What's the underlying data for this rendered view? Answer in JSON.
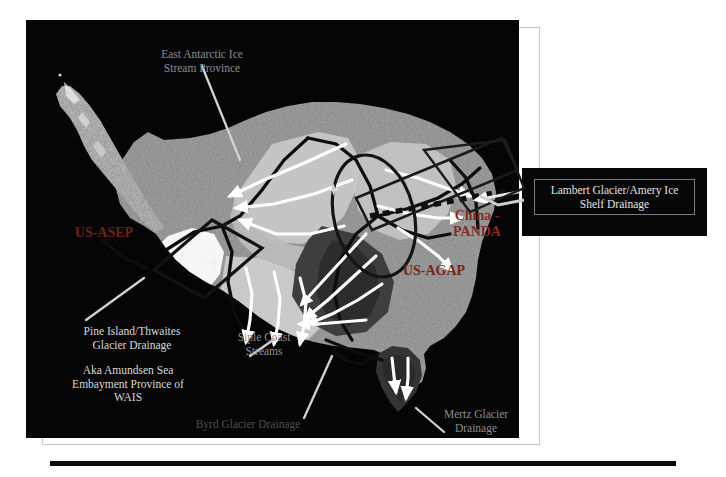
{
  "slide": {
    "background_color": "#ffffff",
    "frame_color": "#c9c9c9",
    "rule_color": "#0a0a0a"
  },
  "map": {
    "name": "antarctica-drainage-basin-map",
    "background_color": "#050505",
    "ice_color": "#8e8e8e",
    "highlight_color": "#f2f2f2",
    "dark_basin_color": "#3a3a3a",
    "boundary_color": "#111111",
    "arrow_color": "#ffffff",
    "labels": [
      {
        "name": "east-antarctic-ice-stream-province",
        "text": "East Antarctic Ice\nStream Province",
        "style": "dim"
      },
      {
        "name": "pine-island-thwaites-glacier-drainage",
        "text": "Pine Island/Thwaites\nGlacier Drainage",
        "style": "normal"
      },
      {
        "name": "amundsen-sea-embayment-province",
        "text": "Aka Amundsen Sea\nEmbayment Province of\nWAIS",
        "style": "normal"
      },
      {
        "name": "siple-coast-streams",
        "text": "Siple Coast\nStreams",
        "style": "dim"
      },
      {
        "name": "byrd-glacier-drainage",
        "text": "Byrd Glacier Drainage",
        "style": "dimmer"
      },
      {
        "name": "mertz-glacier-drainage",
        "text": "Mertz Glacier\nDrainage",
        "style": "dim"
      }
    ],
    "project_labels": [
      {
        "name": "us-asep-project",
        "text": "US-ASEP",
        "color": "#6e2218"
      },
      {
        "name": "china-panda-project",
        "text": "China -\nPANDA",
        "color": "#8a2a1e"
      },
      {
        "name": "us-agap-project",
        "text": "US-AGAP",
        "color": "#7a2318"
      }
    ]
  },
  "callout": {
    "name": "lambert-glacier-callout",
    "text": "Lambert Glacier/Amery Ice\nShelf Drainage",
    "background_color": "#070707",
    "border_color": "#7d7d7d",
    "text_color": "#e2e2e2"
  }
}
